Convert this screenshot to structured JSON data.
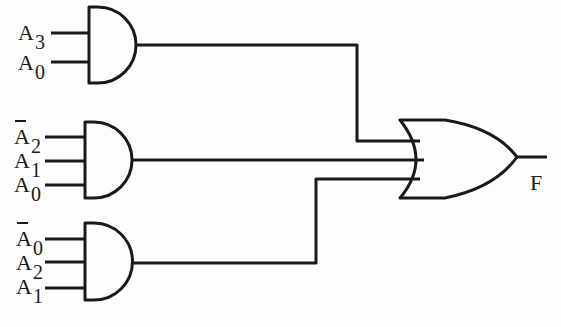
{
  "diagram": {
    "type": "logic-circuit",
    "stroke_color": "#1a1a1a",
    "gates": [
      {
        "id": "and1",
        "type": "AND",
        "inputs": [
          {
            "var": "A",
            "sub": "3",
            "negated": false
          },
          {
            "var": "A",
            "sub": "0",
            "negated": false
          }
        ]
      },
      {
        "id": "and2",
        "type": "AND",
        "inputs": [
          {
            "var": "A",
            "sub": "2",
            "negated": true
          },
          {
            "var": "A",
            "sub": "1",
            "negated": false
          },
          {
            "var": "A",
            "sub": "0",
            "negated": false
          }
        ]
      },
      {
        "id": "and3",
        "type": "AND",
        "inputs": [
          {
            "var": "A",
            "sub": "0",
            "negated": true
          },
          {
            "var": "A",
            "sub": "2",
            "negated": false
          },
          {
            "var": "A",
            "sub": "1",
            "negated": false
          }
        ]
      },
      {
        "id": "or1",
        "type": "OR",
        "inputs": [
          "and1",
          "and2",
          "and3"
        ],
        "output": "F"
      }
    ],
    "output_label": "F"
  },
  "labels": {
    "g1_in1": {
      "var": "A",
      "sub": "3"
    },
    "g1_in2": {
      "var": "A",
      "sub": "0"
    },
    "g2_in1": {
      "var": "A",
      "sub": "2"
    },
    "g2_in2": {
      "var": "A",
      "sub": "1"
    },
    "g2_in3": {
      "var": "A",
      "sub": "0"
    },
    "g3_in1": {
      "var": "A",
      "sub": "0"
    },
    "g3_in2": {
      "var": "A",
      "sub": "2"
    },
    "g3_in3": {
      "var": "A",
      "sub": "1"
    },
    "output": "F"
  }
}
